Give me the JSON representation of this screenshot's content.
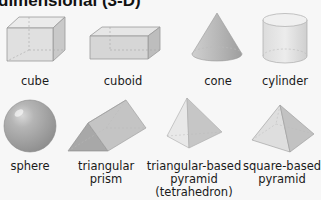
{
  "title": "dimensional (3-D)",
  "shapes": [
    {
      "name": "cube",
      "label": "cube"
    },
    {
      "name": "cuboid",
      "label": "cuboid"
    },
    {
      "name": "cone",
      "label": "cone"
    },
    {
      "name": "cylinder",
      "label": "cylinder"
    },
    {
      "name": "sphere",
      "label": "sphere"
    },
    {
      "name": "triangular-prism",
      "label_line1": "triangular",
      "label_line2": "prism"
    },
    {
      "name": "tetrahedron",
      "label_line1": "triangular-based",
      "label_line2": "pyramid",
      "label_line3": "(tetrahedron)"
    },
    {
      "name": "square-pyramid",
      "label_line1": "square-based",
      "label_line2": "pyramid"
    }
  ]
}
